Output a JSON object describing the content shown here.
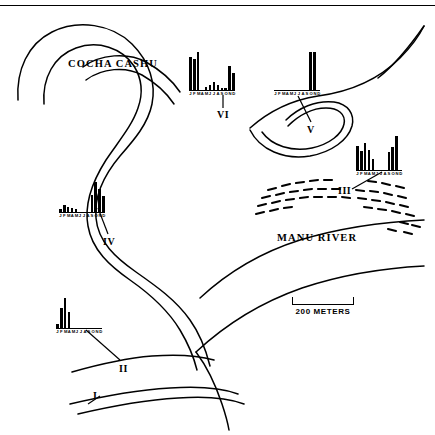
{
  "figure": {
    "top_rule": true,
    "background_color": "#ffffff",
    "ink_color": "#000000"
  },
  "map": {
    "labels": [
      {
        "name": "cocha-cashu",
        "text": "COCHA  CASHU"
      },
      {
        "name": "manu-river",
        "text": "MANU  RIVER"
      }
    ],
    "scale_bar": {
      "label": "200 METERS",
      "length_px": 62
    },
    "site_markers": [
      {
        "id": "I",
        "text": "I"
      },
      {
        "id": "II",
        "text": "II"
      },
      {
        "id": "III",
        "text": "III"
      },
      {
        "id": "IV",
        "text": "IV"
      },
      {
        "id": "V",
        "text": "V"
      },
      {
        "id": "VI",
        "text": "VI"
      }
    ]
  },
  "chart_data": [
    {
      "type": "bar",
      "id": "I",
      "title": "I",
      "note": "site I marker only - no histogram shown",
      "categories": [],
      "values": [],
      "xlabel": "",
      "ylabel": "",
      "ylim": [
        0,
        100
      ]
    },
    {
      "type": "bar",
      "id": "II",
      "title": "II",
      "categories": [
        "J",
        "F",
        "M",
        "A",
        "M",
        "J",
        "J",
        "A",
        "S",
        "O",
        "N",
        "D"
      ],
      "tick_labels": [
        "J",
        "F",
        "M",
        "A",
        "M",
        "J",
        "J",
        "A",
        "S",
        "O",
        "N",
        "D"
      ],
      "values": [
        12,
        68,
        100,
        55,
        0,
        0,
        0,
        0,
        0,
        0,
        0,
        0
      ],
      "xlabel": "",
      "ylabel": "",
      "ylim": [
        0,
        100
      ],
      "grid": false
    },
    {
      "type": "bar",
      "id": "III",
      "title": "III",
      "categories": [
        "J",
        "F",
        "M",
        "A",
        "M",
        "J",
        "J",
        "A",
        "S",
        "O",
        "N",
        "D"
      ],
      "tick_labels": [
        "J",
        "F",
        "M",
        "A",
        "M",
        "J",
        "J",
        "A",
        "S",
        "O",
        "N",
        "D"
      ],
      "values": [
        72,
        55,
        78,
        60,
        33,
        0,
        0,
        0,
        52,
        68,
        100,
        0
      ],
      "xlabel": "",
      "ylabel": "",
      "ylim": [
        0,
        100
      ],
      "grid": false
    },
    {
      "type": "bar",
      "id": "IV",
      "title": "IV",
      "categories": [
        "J",
        "F",
        "M",
        "A",
        "M",
        "J",
        "J",
        "A",
        "S",
        "O",
        "N",
        "D"
      ],
      "tick_labels": [
        "J",
        "F",
        "M",
        "A",
        "M",
        "J",
        "J",
        "A",
        "S",
        "O",
        "N",
        "D"
      ],
      "values": [
        10,
        22,
        16,
        14,
        9,
        0,
        0,
        0,
        58,
        100,
        78,
        55
      ],
      "xlabel": "",
      "ylabel": "",
      "ylim": [
        0,
        100
      ],
      "grid": false
    },
    {
      "type": "bar",
      "id": "V",
      "title": "V",
      "categories": [
        "J",
        "F",
        "M",
        "A",
        "M",
        "J",
        "J",
        "A",
        "S",
        "O",
        "N",
        "D"
      ],
      "tick_labels": [
        "J",
        "F",
        "M",
        "A",
        "M",
        "J",
        "J",
        "A",
        "S",
        "O",
        "N",
        "D"
      ],
      "values": [
        0,
        0,
        0,
        0,
        0,
        0,
        0,
        0,
        0,
        100,
        100,
        0
      ],
      "xlabel": "",
      "ylabel": "",
      "ylim": [
        0,
        100
      ],
      "grid": false
    },
    {
      "type": "bar",
      "id": "VI",
      "title": "VI",
      "categories": [
        "J",
        "F",
        "M",
        "A",
        "M",
        "J",
        "J",
        "A",
        "S",
        "O",
        "N",
        "D"
      ],
      "tick_labels": [
        "J",
        "F",
        "M",
        "A",
        "M",
        "J",
        "J",
        "A",
        "S",
        "O",
        "N",
        "D"
      ],
      "values": [
        88,
        82,
        100,
        0,
        8,
        14,
        22,
        12,
        6,
        6,
        62,
        44
      ],
      "xlabel": "",
      "ylabel": "",
      "ylim": [
        0,
        100
      ],
      "grid": false
    }
  ]
}
